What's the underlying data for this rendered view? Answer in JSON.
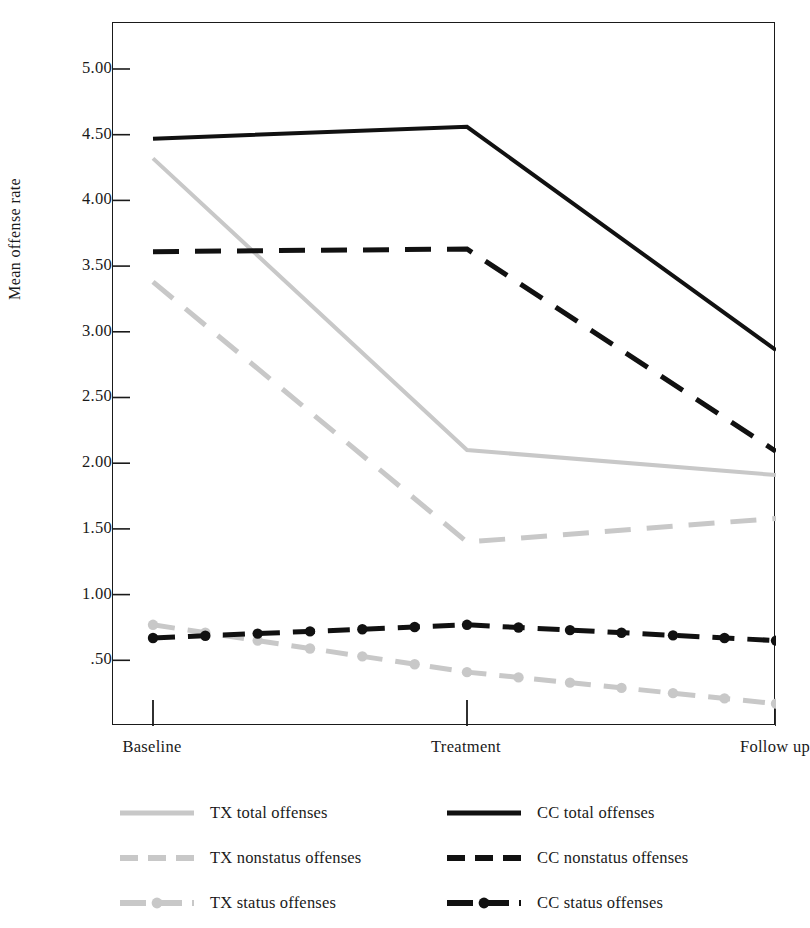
{
  "chart_data": {
    "type": "line",
    "title": "",
    "xlabel": "",
    "ylabel": "Mean offense rate",
    "categories": [
      "Baseline",
      "Treatment",
      "Follow up"
    ],
    "ylim": [
      0.0,
      5.35
    ],
    "yticks": [
      5.0,
      4.5,
      4.0,
      3.5,
      3.0,
      2.5,
      2.0,
      1.5,
      1.0,
      0.5
    ],
    "ytick_labels": [
      "5.00",
      "4.50",
      "4.00",
      "3.50",
      "3.00",
      "2.50",
      "2.00",
      "1.50",
      "1.00",
      ".50"
    ],
    "grid": false,
    "legend_position": "below-plot",
    "series": [
      {
        "name": "TX  total offenses",
        "group": "TX",
        "measure": "total offenses",
        "values": [
          4.32,
          2.1,
          1.91
        ],
        "color": "#c8c8c8",
        "style": "solid",
        "marker": "none",
        "width": 4
      },
      {
        "name": "TX nonstatus offenses",
        "group": "TX",
        "measure": "nonstatus offenses",
        "values": [
          3.38,
          1.4,
          1.58
        ],
        "color": "#c8c8c8",
        "style": "dashed",
        "marker": "none",
        "width": 5
      },
      {
        "name": "TX status offenses",
        "group": "TX",
        "measure": "status offenses",
        "values": [
          0.77,
          0.41,
          0.17
        ],
        "color": "#c8c8c8",
        "style": "dash-dot",
        "marker": "circle",
        "width": 5
      },
      {
        "name": "CC  total offenses",
        "group": "CC",
        "measure": "total offenses",
        "values": [
          4.47,
          4.56,
          2.86
        ],
        "color": "#111111",
        "style": "solid",
        "marker": "none",
        "width": 4
      },
      {
        "name": "CC nonstatus offenses",
        "group": "CC",
        "measure": "nonstatus offenses",
        "values": [
          3.61,
          3.63,
          2.09
        ],
        "color": "#111111",
        "style": "dashed",
        "marker": "none",
        "width": 5
      },
      {
        "name": "CC status offenses",
        "group": "CC",
        "measure": "status offenses",
        "values": [
          0.67,
          0.77,
          0.65
        ],
        "color": "#111111",
        "style": "dash-dot",
        "marker": "circle",
        "width": 5
      }
    ]
  },
  "legend": {
    "left_entries": [
      {
        "label": "TX  total offenses",
        "style": "solid",
        "marker": "none",
        "color": "#c8c8c8"
      },
      {
        "label": "TX nonstatus offenses",
        "style": "dashed",
        "marker": "none",
        "color": "#c8c8c8"
      },
      {
        "label": "TX status offenses",
        "style": "dash-dot",
        "marker": "circle",
        "color": "#c8c8c8"
      }
    ],
    "right_entries": [
      {
        "label": "CC  total offenses",
        "style": "solid",
        "marker": "none",
        "color": "#111111"
      },
      {
        "label": "CC nonstatus offenses",
        "style": "dashed",
        "marker": "none",
        "color": "#111111"
      },
      {
        "label": "CC status offenses",
        "style": "dash-dot",
        "marker": "circle",
        "color": "#111111"
      }
    ]
  },
  "colors": {
    "tx": "#c8c8c8",
    "cc": "#111111",
    "axis": "#1a1a1a",
    "background": "#ffffff"
  }
}
